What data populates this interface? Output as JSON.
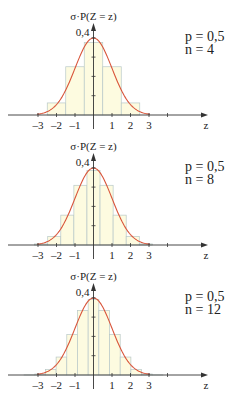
{
  "colors": {
    "bar_fill": "#fdfbe0",
    "bar_stroke": "#b8c8c8",
    "curve": "#d9553a",
    "axis": "#333333",
    "text": "#222222"
  },
  "layout": {
    "origin_x": 93.5,
    "unit_px": 18.5,
    "y_px_per_unit": 193,
    "axis_x_start": 8,
    "axis_x_end": 208,
    "panel_axis_y": 115,
    "panel_top_offsets": [
      0,
      130,
      260
    ]
  },
  "chart_data": [
    {
      "type": "bar",
      "title": "",
      "ylabel": "σ·P(Z = z)",
      "xlabel": "z",
      "y_tick_label": "0,4",
      "y_ticks": [
        0.1,
        0.2,
        0.3,
        0.4
      ],
      "x_tick_labels": [
        "-3",
        "-2",
        "-1",
        "1",
        "2",
        "3"
      ],
      "x_ticks": [
        -3,
        -2,
        -1,
        1,
        2,
        3,
        4
      ],
      "xlim": [
        -4.5,
        6.2
      ],
      "ylim": [
        0,
        0.42
      ],
      "params": {
        "p": "p = 0,5",
        "n": "n = 4"
      },
      "n": 4,
      "sigma": 1.0,
      "bar_width": 1.0,
      "bar_centers": [
        -2,
        -1,
        0,
        1,
        2
      ],
      "values": [
        0.0625,
        0.25,
        0.375,
        0.25,
        0.0625
      ],
      "overlay": "standard normal density curve"
    },
    {
      "type": "bar",
      "title": "",
      "ylabel": "σ·P(Z = z)",
      "xlabel": "z",
      "y_tick_label": "0,4",
      "y_ticks": [
        0.1,
        0.2,
        0.3,
        0.4
      ],
      "x_tick_labels": [
        "-3",
        "-2",
        "-1",
        "1",
        "2",
        "3"
      ],
      "x_ticks": [
        -3,
        -2,
        -1,
        1,
        2,
        3,
        4
      ],
      "xlim": [
        -4.5,
        6.2
      ],
      "ylim": [
        0,
        0.42
      ],
      "params": {
        "p": "p = 0,5",
        "n": "n = 8"
      },
      "n": 8,
      "sigma": 1.4142,
      "bar_width": 0.7071,
      "bar_centers": [
        -2.8284,
        -2.1213,
        -1.4142,
        -0.7071,
        0,
        0.7071,
        1.4142,
        2.1213,
        2.8284
      ],
      "values": [
        0.0055,
        0.0442,
        0.1547,
        0.3094,
        0.3867,
        0.3094,
        0.1547,
        0.0442,
        0.0055
      ],
      "overlay": "standard normal density curve"
    },
    {
      "type": "bar",
      "title": "",
      "ylabel": "σ·P(Z = z)",
      "xlabel": "z",
      "y_tick_label": "0,4",
      "y_ticks": [
        0.1,
        0.2,
        0.3,
        0.4
      ],
      "x_tick_labels": [
        "-3",
        "-2",
        "-1",
        "1",
        "2",
        "3"
      ],
      "x_ticks": [
        -3,
        -2,
        -1,
        1,
        2,
        3,
        4
      ],
      "xlim": [
        -4.5,
        6.2
      ],
      "ylim": [
        0,
        0.42
      ],
      "params": {
        "p": "p = 0,5",
        "n": "n = 12"
      },
      "n": 12,
      "sigma": 1.7321,
      "bar_width": 0.5774,
      "bar_centers": [
        -3.4641,
        -2.8868,
        -2.3094,
        -1.7321,
        -1.1547,
        -0.5774,
        0,
        0.5774,
        1.1547,
        1.7321,
        2.3094,
        2.8868,
        3.4641
      ],
      "values": [
        0.0004,
        0.0051,
        0.0279,
        0.093,
        0.2093,
        0.3348,
        0.3906,
        0.3348,
        0.2093,
        0.093,
        0.0279,
        0.0051,
        0.0004
      ],
      "overlay": "standard normal density curve"
    }
  ]
}
